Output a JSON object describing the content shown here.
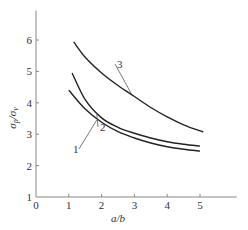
{
  "chart_data": {
    "type": "line",
    "title": "",
    "xlabel": "a/b",
    "ylabel": "σp/σv",
    "xlim": [
      0,
      6
    ],
    "ylim": [
      1,
      7
    ],
    "x_ticks": [
      0,
      1,
      2,
      3,
      4,
      5
    ],
    "y_ticks": [
      1,
      2,
      3,
      4,
      5,
      6
    ],
    "grid": false,
    "legend": "inline curve labels",
    "series": [
      {
        "name": "1",
        "x": [
          1.0,
          1.5,
          2.0,
          2.5,
          3.0,
          3.5,
          4.0,
          4.5,
          5.0
        ],
        "values": [
          4.4,
          3.8,
          3.38,
          3.08,
          2.88,
          2.72,
          2.6,
          2.52,
          2.46
        ]
      },
      {
        "name": "2",
        "x": [
          1.1,
          1.5,
          2.0,
          2.5,
          3.0,
          3.5,
          4.0,
          4.5,
          5.0
        ],
        "values": [
          4.95,
          4.1,
          3.52,
          3.22,
          3.03,
          2.88,
          2.76,
          2.68,
          2.62
        ]
      },
      {
        "name": "3",
        "x": [
          1.15,
          1.5,
          2.0,
          2.5,
          3.0,
          3.5,
          4.0,
          4.5,
          5.1
        ],
        "values": [
          5.94,
          5.45,
          4.95,
          4.55,
          4.2,
          3.85,
          3.55,
          3.3,
          3.07
        ]
      }
    ]
  }
}
